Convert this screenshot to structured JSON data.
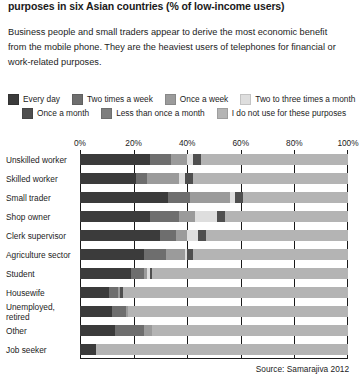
{
  "headline": "purposes in six Asian countries (% of low-income users)",
  "intro": "Business people and small traders appear to derive the most economic benefit from the mobile phone. They are the heaviest users of telephones for financial or work-related purposes.",
  "source": "Source: Samarajiva 2012",
  "legend": {
    "row1": [
      {
        "label": "Every day",
        "color": "#3b3b3b"
      },
      {
        "label": "Two times a week",
        "color": "#6e6e6e"
      },
      {
        "label": "Once a week",
        "color": "#9b9b9b"
      },
      {
        "label": "Two to three times a month",
        "color": "#dedede"
      }
    ],
    "row2": [
      {
        "label": "Once a month",
        "color": "#4f4f4f"
      },
      {
        "label": "Less than once a month",
        "color": "#7e7e7e"
      },
      {
        "label": "I do not use for these purposes",
        "color": "#b4b4b4"
      }
    ]
  },
  "chart_data": {
    "type": "bar",
    "subtype": "stacked-horizontal-100",
    "title": "purposes in six Asian countries (% of low-income users)",
    "xlabel": "",
    "ylabel": "",
    "xlim": [
      0,
      100
    ],
    "xticks": [
      0,
      20,
      40,
      60,
      80,
      100
    ],
    "xticklabels": [
      "0%",
      "20%",
      "40%",
      "60%",
      "80%",
      "100%"
    ],
    "grid": true,
    "legend_position": "top",
    "categories": [
      "Unskilled worker",
      "Skilled worker",
      "Small trader",
      "Shop owner",
      "Clerk supervisor",
      "Agriculture sector",
      "Student",
      "Housewife",
      "Unemployed, retired",
      "Other",
      "Job seeker"
    ],
    "series": [
      {
        "name": "Every day",
        "color": "#3b3b3b",
        "values": [
          26,
          21,
          33,
          26,
          30,
          24,
          19,
          11,
          12,
          13,
          6
        ]
      },
      {
        "name": "Two times a week",
        "color": "#6e6e6e",
        "values": [
          8,
          4,
          8,
          11,
          6,
          8,
          5,
          3,
          5,
          11,
          0
        ]
      },
      {
        "name": "Once a week",
        "color": "#9b9b9b",
        "values": [
          6,
          12,
          15,
          6,
          4,
          7,
          1,
          1,
          1,
          3,
          0
        ]
      },
      {
        "name": "Two to three times a month",
        "color": "#dedede",
        "values": [
          2,
          2,
          2,
          8,
          4,
          1,
          1,
          0,
          0,
          0,
          0
        ]
      },
      {
        "name": "Once a month",
        "color": "#4f4f4f",
        "values": [
          3,
          3,
          3,
          3,
          3,
          2,
          1,
          1,
          0,
          0,
          0
        ]
      },
      {
        "name": "Less than once a month",
        "color": "#7e7e7e",
        "values": [
          0,
          0,
          0,
          0,
          0,
          0,
          0,
          0,
          0,
          0,
          0
        ]
      },
      {
        "name": "I do not use for these purposes",
        "color": "#b4b4b4",
        "values": [
          55,
          58,
          39,
          46,
          53,
          58,
          73,
          84,
          82,
          73,
          94
        ]
      }
    ]
  }
}
